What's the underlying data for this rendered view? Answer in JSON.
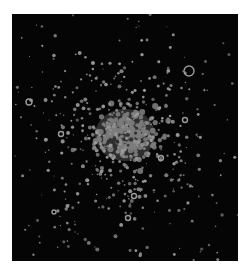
{
  "image": {
    "subject": "star cluster",
    "background_color": "#ffffff",
    "field_color": "#050505",
    "star_color": "#9a9a9a",
    "core_color": "#7c7c7c",
    "core_dark_center_color": "#2a2a2a",
    "frame": {
      "x": 12,
      "y": 14,
      "width": 226,
      "height": 247
    },
    "core": {
      "cx": 125,
      "cy": 135,
      "rx": 30,
      "ry": 26
    },
    "ring_stars": [
      {
        "x": 189,
        "y": 71,
        "r": 5
      },
      {
        "x": 29,
        "y": 102,
        "r": 3
      },
      {
        "x": 61,
        "y": 134,
        "r": 2.5
      },
      {
        "x": 161,
        "y": 158,
        "r": 2.5
      },
      {
        "x": 185,
        "y": 120,
        "r": 2.5
      },
      {
        "x": 128,
        "y": 218,
        "r": 2.5
      },
      {
        "x": 134,
        "y": 196,
        "r": 2.5
      },
      {
        "x": 54,
        "y": 212,
        "r": 2
      }
    ]
  }
}
